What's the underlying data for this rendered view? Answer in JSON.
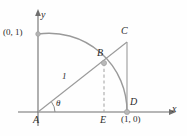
{
  "figure": {
    "background_color": "#fefefe",
    "stroke_color": "#8a8a8a",
    "axis_color": "#6e6e6e",
    "text_color": "#2b2b2b",
    "point_fill": "#b3b3b3"
  },
  "axes": {
    "x_label": "x",
    "y_label": "y",
    "origin_label": "A",
    "x_axis_from": [
      38,
      112
    ],
    "x_axis_to": [
      176,
      112
    ],
    "y_axis_from": [
      38,
      126
    ],
    "y_axis_to": [
      38,
      10
    ]
  },
  "points": {
    "A": {
      "label": "A",
      "x": 38,
      "y": 112,
      "note": "origin / vertex of angle"
    },
    "B": {
      "label": "B",
      "x": 104,
      "y": 63,
      "note": "point on unit circle arc"
    },
    "C": {
      "label": "C",
      "x": 127,
      "y": 42,
      "note": "intersection of ray AB extended with vertical line at x=1"
    },
    "D": {
      "label": "D",
      "x": 127,
      "y": 112,
      "note": "point (1,0) on x-axis"
    },
    "E": {
      "label": "E",
      "x": 104,
      "y": 112,
      "note": "foot of perpendicular from B"
    }
  },
  "labels": {
    "y_axis": "y",
    "x_axis": "x",
    "zero_one": "(0, 1)",
    "one_zero": "(1, 0)",
    "point_a": "A",
    "point_b": "B",
    "point_c": "C",
    "point_d": "D",
    "point_e": "E",
    "theta": "θ",
    "radius_length": "1"
  },
  "geometry": {
    "arc": {
      "type": "quarter-circle",
      "center": [
        38,
        112
      ],
      "radius": 89,
      "start": [
        38,
        34
      ],
      "end": [
        127,
        112
      ],
      "description": "unit circle arc from (0,1) to (1,0)"
    },
    "segments": [
      {
        "name": "hypotenuse-AC",
        "from": "A",
        "to": "C",
        "style": "solid",
        "label": "1 on AB portion"
      },
      {
        "name": "vertical-CD",
        "from": "C",
        "to": "D",
        "style": "solid"
      },
      {
        "name": "perpendicular-BE",
        "from": "B",
        "to": "E",
        "style": "dashed"
      }
    ],
    "angle": {
      "name": "theta",
      "at": "A",
      "between": [
        "AD (x-axis)",
        "AC (ray)"
      ],
      "symbol": "θ",
      "arc_radius": 16
    }
  }
}
